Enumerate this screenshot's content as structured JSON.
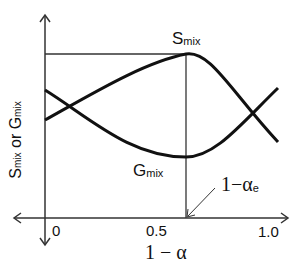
{
  "diagram": {
    "y_axis_label": {
      "s": "S",
      "s_sub": "mix",
      "or": " or ",
      "g": "G",
      "g_sub": "mix"
    },
    "x_axis_label": "1 − α",
    "x_ticks": [
      {
        "label": "0",
        "value": 0
      },
      {
        "label": "0.5",
        "value": 0.5
      },
      {
        "label": "1.0",
        "value": 1.0
      }
    ],
    "curves": [
      {
        "name": "S",
        "sub": "mix",
        "shape": "maximum at 1-αe"
      },
      {
        "name": "G",
        "sub": "mix",
        "shape": "minimum at 1-αe"
      }
    ],
    "annotation": {
      "text": "1−α",
      "sub": "e"
    },
    "colors": {
      "line": "#111111",
      "guide": "#333333",
      "background": "#ffffff"
    }
  }
}
